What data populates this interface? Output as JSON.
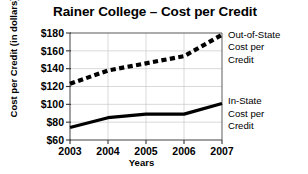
{
  "chart_data": {
    "type": "line",
    "title": "Rainer College – Cost per Credit",
    "xlabel": "Years",
    "ylabel": "Cost per Credit (in dollars)",
    "categories": [
      "2003",
      "2004",
      "2005",
      "2006",
      "2007"
    ],
    "x": [
      2003,
      2004,
      2005,
      2006,
      2007
    ],
    "xlim": [
      2003,
      2007
    ],
    "ylim": [
      60,
      180
    ],
    "ytick_labels": [
      "$60",
      "$80",
      "$100",
      "$120",
      "$140",
      "$160",
      "$180"
    ],
    "ytick_values": [
      60,
      80,
      100,
      120,
      140,
      160,
      180
    ],
    "grid": true,
    "legend_position": "right-inline-annotations",
    "series": [
      {
        "name": "Out-of-State Cost per Credit",
        "annotation_lines": [
          "Out-of-State",
          "Cost per",
          "Credit"
        ],
        "style": "dashed",
        "color": "#000000",
        "values": [
          123,
          138,
          146,
          154,
          178
        ]
      },
      {
        "name": "In-State Cost per Credit",
        "annotation_lines": [
          "In-State",
          "Cost per",
          "Credit"
        ],
        "style": "solid",
        "color": "#000000",
        "values": [
          74,
          85,
          89,
          89,
          101
        ]
      }
    ]
  },
  "colors": {
    "background": "#ffffff",
    "ink": "#000000",
    "gridline": "#c8c8c8",
    "frame": "#6b6b6b"
  }
}
